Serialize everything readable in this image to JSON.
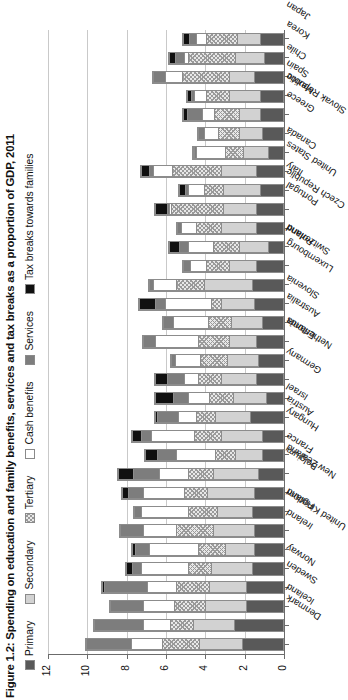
{
  "figure": {
    "title": "Figure 1.2: Spending on education and family benefits, services and tax breaks as a proportion of GDP, 2011"
  },
  "legend": [
    {
      "label": "Primary",
      "key": "primary",
      "swatch": "#595959"
    },
    {
      "label": "Secondary",
      "key": "secondary",
      "swatch": "#d2d2d2"
    },
    {
      "label": "Tertiary",
      "key": "tertiary",
      "swatch": "#e8e8e8"
    },
    {
      "label": "Cash benefits",
      "key": "cash",
      "swatch": "#ffffff"
    },
    {
      "label": "Services",
      "key": "services",
      "swatch": "#7d7d7d"
    },
    {
      "label": "Tax breaks towards families",
      "key": "tax",
      "swatch": "#101010"
    }
  ],
  "chart_data": {
    "type": "bar",
    "orientation": "vertical-stacked",
    "title": "Figure 1.2: Spending on education and family benefits, services and tax breaks as a proportion of GDP, 2011",
    "xlabel": "",
    "ylabel": "",
    "ylim": [
      0,
      12
    ],
    "yticks": [
      0,
      2,
      4,
      6,
      8,
      10,
      12
    ],
    "ytick_labels": [
      "0",
      "2",
      "4",
      "6",
      "8",
      "10",
      "12"
    ],
    "grid": true,
    "legend_position": "top",
    "stacked": true,
    "categories": [
      "Denmark",
      "Iceland",
      "Sweden",
      "Norway",
      "United Kingdom",
      "Ireland",
      "Finland",
      "New Zealand",
      "Belgium",
      "France",
      "Hungary",
      "Austria",
      "Israel",
      "Germany",
      "Netherlands",
      "Estonia",
      "Australia",
      "Slovenia",
      "Luxembourg",
      "Switzerland",
      "Poland",
      "Czech Republic",
      "Portugal",
      "United States",
      "Italy",
      "Canada",
      "Slovak Republic",
      "Greece",
      "Mexico",
      "Spain",
      "Chile",
      "Korea",
      "Japan"
    ],
    "series": [
      {
        "name": "Primary",
        "key": "primary",
        "values": [
          2.1,
          2.5,
          1.9,
          1.9,
          1.6,
          1.5,
          1.5,
          1.6,
          1.5,
          1.3,
          1.1,
          1.1,
          1.7,
          0.9,
          1.4,
          1.3,
          1.4,
          1.1,
          1.5,
          1.6,
          1.4,
          0.8,
          1.4,
          1.4,
          1.2,
          1.4,
          0.8,
          1.1,
          1.2,
          1.2,
          1.5,
          1.0,
          1.2
        ]
      },
      {
        "name": "Secondary",
        "key": "secondary",
        "values": [
          2.2,
          2.1,
          2.1,
          1.9,
          2.1,
          1.5,
          2.1,
          1.8,
          2.4,
          2.3,
          1.4,
          2.1,
          1.8,
          1.7,
          1.8,
          1.6,
          1.4,
          1.6,
          1.7,
          2.5,
          1.4,
          1.5,
          1.8,
          1.7,
          1.9,
          1.8,
          1.3,
          1.2,
          1.1,
          1.6,
          1.3,
          1.5,
          1.2
        ]
      },
      {
        "name": "Tertiary",
        "key": "tertiary",
        "values": [
          1.9,
          1.2,
          1.6,
          1.7,
          1.2,
          1.4,
          1.9,
          1.5,
          1.2,
          1.3,
          1.0,
          1.4,
          1.0,
          1.2,
          1.2,
          1.4,
          1.6,
          1.2,
          0.5,
          1.4,
          1.2,
          1.3,
          1.3,
          2.7,
          1.0,
          2.5,
          0.9,
          1.1,
          1.3,
          1.2,
          2.4,
          2.4,
          1.6
        ]
      },
      {
        "name": "Cash benefits",
        "key": "cash",
        "values": [
          1.6,
          1.4,
          1.6,
          1.5,
          2.4,
          2.5,
          1.7,
          2.4,
          2.1,
          1.5,
          2.0,
          2.2,
          0.9,
          1.1,
          0.7,
          1.3,
          2.2,
          1.8,
          2.4,
          1.2,
          0.8,
          1.3,
          0.8,
          0.1,
          0.8,
          1.0,
          1.5,
          0.7,
          0.6,
          0.6,
          0.9,
          0.2,
          0.5
        ]
      },
      {
        "name": "Services",
        "key": "services",
        "values": [
          2.3,
          2.5,
          1.7,
          2.2,
          0.5,
          0.7,
          1.2,
          0.4,
          0.8,
          1.3,
          1.0,
          0.5,
          1.1,
          0.8,
          0.9,
          0.2,
          0.6,
          0.5,
          0.5,
          0.2,
          0.4,
          0.5,
          0.2,
          0.1,
          0.2,
          0.2,
          0.1,
          0.3,
          0.8,
          0.2,
          0.6,
          0.5,
          0.4
        ]
      },
      {
        "name": "Tax breaks towards families",
        "key": "tax",
        "values": [
          0.0,
          0.0,
          0.0,
          0.1,
          0.3,
          0.2,
          0.0,
          0.0,
          0.3,
          0.8,
          0.6,
          0.5,
          0.1,
          0.9,
          0.6,
          0.0,
          0.0,
          0.0,
          0.8,
          0.0,
          0.0,
          0.5,
          0.0,
          0.6,
          0.3,
          0.4,
          0.1,
          0.0,
          0.2,
          0.2,
          0.0,
          0.3,
          0.3
        ]
      }
    ]
  }
}
